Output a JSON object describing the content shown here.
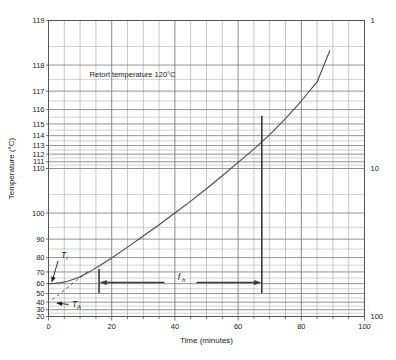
{
  "chart_data": {
    "type": "line",
    "title": "",
    "xlabel": "Time (minutes)",
    "ylabel": "Temperature (°C)",
    "xlim": [
      0,
      100
    ],
    "x_ticks": [
      0,
      20,
      40,
      60,
      80,
      100
    ],
    "x_minor_step": 5,
    "y_scale": "inverse-log (semi-log heat penetration)",
    "y_reference_temperature": 120,
    "y_ticks_left": [
      119,
      118,
      117,
      116,
      115,
      114,
      113,
      112,
      111,
      110,
      100,
      90,
      80,
      70,
      60,
      50,
      40,
      30,
      20
    ],
    "y_ticks_right": [
      "1",
      "10",
      "100"
    ],
    "y_right_values": [
      1,
      10,
      100
    ],
    "grid": true,
    "legend": false,
    "series": [
      {
        "name": "Product temperature",
        "x": [
          0,
          2,
          4,
          6,
          8,
          10,
          12,
          14,
          16,
          20,
          25,
          30,
          35,
          40,
          45,
          50,
          55,
          60,
          65,
          70,
          75,
          80,
          85,
          89
        ],
        "y": [
          60.0,
          60.3,
          61.0,
          62.2,
          64.0,
          66.2,
          68.8,
          71.6,
          74.4,
          79.8,
          86.0,
          91.4,
          96.0,
          100.0,
          103.4,
          106.3,
          108.8,
          110.9,
          112.6,
          114.1,
          115.4,
          116.5,
          117.4,
          118.4
        ]
      }
    ],
    "annotations": [
      {
        "name": "retort-temperature-note",
        "text": "Retort temperature 120°C",
        "x": 13,
        "y": 117.7
      },
      {
        "name": "initial-temperature-label",
        "symbol": "T",
        "subscript": "i",
        "points_to_x": 0,
        "points_to_y": 60
      },
      {
        "name": "ambient-temperature-label",
        "symbol": "T",
        "subscript": "A",
        "points_to_x": 1,
        "points_to_y": 40
      },
      {
        "name": "heating-rate-index-label",
        "symbol": "f",
        "subscript": "h",
        "span_x_start": 16,
        "span_x_end": 67.5,
        "at_y": 61
      }
    ],
    "markers": [
      {
        "name": "fh-left-vertical-line",
        "x": 16
      },
      {
        "name": "fh-right-vertical-line",
        "x": 67.5
      }
    ]
  },
  "colors": {
    "frame": "#555555",
    "grid_major": "#777777",
    "grid_minor": "#9a9a9a",
    "curve": "#4a4a4a",
    "marker": "#3a3a3a",
    "text": "#1a1a1a",
    "background": "#ffffff"
  },
  "axes": {
    "left_title": "Temperature (°C)",
    "bottom_title": "Time (minutes)",
    "right_title": ""
  }
}
